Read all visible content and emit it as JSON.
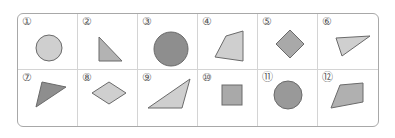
{
  "colors": {
    "light": "#cfcfcf",
    "medium": "#a9a9a9",
    "dark": "#8e8e8e",
    "stroke": "#6a6a6a"
  },
  "cells": [
    {
      "label": "①",
      "shape": "circle",
      "shade": "light"
    },
    {
      "label": "②",
      "shape": "right-triangle",
      "shade": "medium"
    },
    {
      "label": "③",
      "shape": "large-circle",
      "shade": "dark"
    },
    {
      "label": "④",
      "shape": "quadrilateral",
      "shade": "light"
    },
    {
      "label": "⑤",
      "shape": "square-rotated",
      "shade": "medium"
    },
    {
      "label": "⑥",
      "shape": "triangle",
      "shade": "light"
    },
    {
      "label": "⑦",
      "shape": "triangle",
      "shade": "dark"
    },
    {
      "label": "⑧",
      "shape": "rhombus",
      "shade": "light"
    },
    {
      "label": "⑨",
      "shape": "obtuse-triangle",
      "shade": "light"
    },
    {
      "label": "⑩",
      "shape": "square",
      "shade": "medium"
    },
    {
      "label": "⑪",
      "shape": "circle",
      "shade": "dark"
    },
    {
      "label": "⑫",
      "shape": "quadrilateral",
      "shade": "medium"
    }
  ]
}
